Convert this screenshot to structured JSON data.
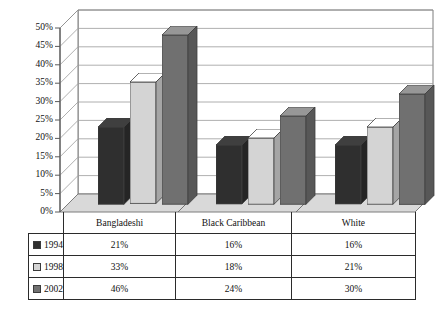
{
  "chart_data": {
    "type": "bar",
    "title": "",
    "subtitle": "",
    "xlabel": "",
    "ylabel": "",
    "categories": [
      "Bangladeshi",
      "Black Caribbean",
      "White"
    ],
    "series": [
      {
        "name": "1994",
        "values": [
          21,
          33,
          46
        ],
        "color": "#2f2f2f",
        "display": [
          "21%",
          "33%",
          "46%"
        ]
      },
      {
        "name": "1998",
        "values": [
          16,
          18,
          24
        ],
        "color": "#d4d4d4",
        "display": [
          "16%",
          "18%",
          "24%"
        ]
      },
      {
        "name": "2002",
        "values": [
          16,
          21,
          30
        ],
        "color": "#707070",
        "display": [
          "16%",
          "21%",
          "30%"
        ]
      }
    ],
    "series_by_year": [
      {
        "name": "1994",
        "color": "#2f2f2f",
        "values": [
          21,
          16,
          16
        ],
        "display": [
          "21%",
          "16%",
          "16%"
        ]
      },
      {
        "name": "1998",
        "color": "#d4d4d4",
        "values": [
          33,
          18,
          21
        ],
        "display": [
          "33%",
          "18%",
          "21%"
        ]
      },
      {
        "name": "2002",
        "color": "#707070",
        "values": [
          46,
          24,
          30
        ],
        "display": [
          "46%",
          "24%",
          "30%"
        ]
      }
    ],
    "ylim": [
      0,
      50
    ],
    "ytick_values": [
      0,
      5,
      10,
      15,
      20,
      25,
      30,
      35,
      40,
      45,
      50
    ],
    "ytick_labels": [
      "0%",
      "5%",
      "10%",
      "15%",
      "20%",
      "25%",
      "30%",
      "35%",
      "40%",
      "45%",
      "50%"
    ],
    "grid": true,
    "legend_position": "table-below",
    "three_d": true
  },
  "table": {
    "row_header_blank": "",
    "column_headers": [
      "Bangladeshi",
      "Black Caribbean",
      "White"
    ],
    "rows": [
      {
        "label": "1994",
        "swatch_color": "#2f2f2f",
        "cells": [
          "21%",
          "16%",
          "16%"
        ]
      },
      {
        "label": "1998",
        "swatch_color": "#d4d4d4",
        "cells": [
          "33%",
          "18%",
          "21%"
        ]
      },
      {
        "label": "2002",
        "swatch_color": "#707070",
        "cells": [
          "46%",
          "24%",
          "30%"
        ]
      }
    ]
  },
  "colors": {
    "series_1994": "#2f2f2f",
    "series_1998": "#d4d4d4",
    "series_2002": "#707070",
    "plot_background": "#ffffff",
    "floor": "#d9d9d9",
    "gridline": "#8a8a8a",
    "axis": "#5a5a5a",
    "table_border": "#2b2b2b"
  }
}
